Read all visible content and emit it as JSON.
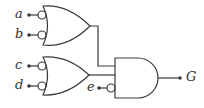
{
  "diagram": {
    "type": "logic-circuit",
    "colors": {
      "stroke": "#3a3a3a",
      "background": "#ffffff",
      "text": "#333333"
    },
    "inputs": [
      {
        "id": "a",
        "label": "a",
        "inverted": true,
        "gate": "or1"
      },
      {
        "id": "b",
        "label": "b",
        "inverted": true,
        "gate": "or1"
      },
      {
        "id": "c",
        "label": "c",
        "inverted": true,
        "gate": "or2"
      },
      {
        "id": "d",
        "label": "d",
        "inverted": true,
        "gate": "or2"
      },
      {
        "id": "e",
        "label": "e",
        "inverted": true,
        "gate": "and1"
      }
    ],
    "gates": [
      {
        "id": "or1",
        "type": "OR",
        "inputs": [
          "a",
          "b"
        ]
      },
      {
        "id": "or2",
        "type": "OR",
        "inputs": [
          "c",
          "d"
        ]
      },
      {
        "id": "and1",
        "type": "AND",
        "inputs": [
          "or1",
          "or2",
          "e"
        ]
      }
    ],
    "output": {
      "id": "G",
      "label": "G",
      "from": "and1"
    }
  }
}
